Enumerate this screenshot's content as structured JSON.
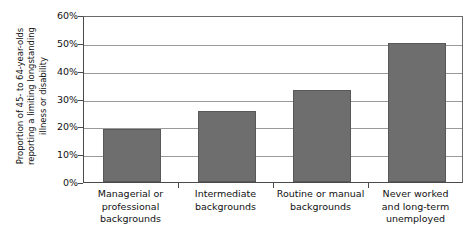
{
  "chart_data": {
    "type": "bar",
    "title": "",
    "subtitle": "",
    "xlabel": "",
    "ylabel": "Proportion of 45- to 64-year-olds\nreporting a limiting longstanding\nillness or disability",
    "categories": [
      "Managerial or\nprofessional\nbackgrounds",
      "Intermediate\nbackgrounds",
      "Routine or manual\nbackgrounds",
      "Never worked\nand long-term\nunemployed"
    ],
    "values": [
      19,
      25.5,
      33,
      50
    ],
    "ylim": [
      0,
      60
    ],
    "ytick_values": [
      0,
      10,
      20,
      30,
      40,
      50,
      60
    ],
    "ytick_labels": [
      "0%",
      "10%",
      "20%",
      "30%",
      "40%",
      "50%",
      "60%"
    ],
    "grid": true,
    "grid_axis": "y",
    "legend": false,
    "legend_position": "none",
    "annotations": [],
    "series": [
      {
        "name": "Proportion reporting limiting longstanding illness or disability",
        "values": [
          19,
          25.5,
          33,
          50
        ],
        "color": "#6e6e6e"
      }
    ]
  },
  "style": {
    "bar_fill": "#6e6e6e",
    "bar_edge": "#585858",
    "gridline_color": "#9a9a9a",
    "axis_color": "#4a4a4a",
    "text_color": "#111111",
    "background": "#ffffff"
  }
}
